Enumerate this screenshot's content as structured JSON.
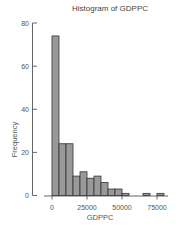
{
  "chart_data": {
    "type": "bar",
    "title": "Histogram of GDPPC",
    "xlabel": "GDPPC",
    "ylabel": "Frequency",
    "bin_width": 5000,
    "bin_edges": [
      0,
      5000,
      10000,
      15000,
      20000,
      25000,
      30000,
      35000,
      40000,
      45000,
      50000,
      55000,
      60000,
      65000,
      70000,
      75000,
      80000
    ],
    "categories": [
      "0-5000",
      "5000-10000",
      "10000-15000",
      "15000-20000",
      "20000-25000",
      "25000-30000",
      "30000-35000",
      "35000-40000",
      "40000-45000",
      "45000-50000",
      "50000-55000",
      "55000-60000",
      "60000-65000",
      "65000-70000",
      "70000-75000",
      "75000-80000"
    ],
    "values": [
      74,
      24,
      24,
      9,
      11,
      8,
      9,
      6,
      3,
      3,
      1,
      0,
      0,
      1,
      0,
      1
    ],
    "x_ticks": [
      0,
      25000,
      50000,
      75000
    ],
    "x_tick_labels": [
      "0",
      "25000",
      "50000",
      "75000"
    ],
    "y_ticks": [
      0,
      20,
      40,
      60,
      80
    ],
    "y_tick_labels": [
      "0",
      "20",
      "40",
      "60",
      "80"
    ],
    "xlim": [
      -5000,
      82000
    ],
    "ylim": [
      0,
      80
    ],
    "grid": false,
    "legend": null,
    "bar_color": "#999999",
    "edge_color": "#333333"
  }
}
